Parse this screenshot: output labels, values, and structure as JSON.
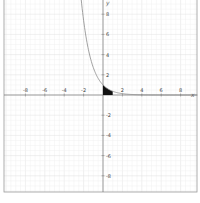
{
  "chart_data": {
    "type": "line",
    "title": "",
    "function": "y = e^(-x)",
    "xlabel": "x",
    "ylabel": "y",
    "xlim": [
      -10.5,
      9.8
    ],
    "ylim": [
      -9.7,
      9.5
    ],
    "grid": true,
    "x_ticks": [
      -8,
      -6,
      -4,
      -2,
      2,
      4,
      6,
      8
    ],
    "y_ticks": [
      8,
      6,
      4,
      2,
      -2,
      -4,
      -6,
      -8
    ],
    "shaded_region": {
      "from_x": 0,
      "to_x": 1,
      "under": "curve",
      "color": "#111111"
    },
    "curve_color": "#888888",
    "sample_points": [
      {
        "x": -2.25,
        "y": 9.49
      },
      {
        "x": -2,
        "y": 7.39
      },
      {
        "x": -1.5,
        "y": 4.48
      },
      {
        "x": -1,
        "y": 2.72
      },
      {
        "x": -0.5,
        "y": 1.65
      },
      {
        "x": 0,
        "y": 1.0
      },
      {
        "x": 0.5,
        "y": 0.61
      },
      {
        "x": 1,
        "y": 0.37
      },
      {
        "x": 2,
        "y": 0.14
      },
      {
        "x": 4,
        "y": 0.02
      }
    ]
  },
  "axes": {
    "x_label": "x",
    "y_label": "y",
    "x_tick_labels": [
      "-8",
      "-6",
      "-4",
      "-2",
      "2",
      "4",
      "6",
      "8"
    ],
    "y_tick_labels": [
      "8",
      "6",
      "4",
      "2",
      "-2",
      "-4",
      "-6",
      "-8"
    ]
  }
}
